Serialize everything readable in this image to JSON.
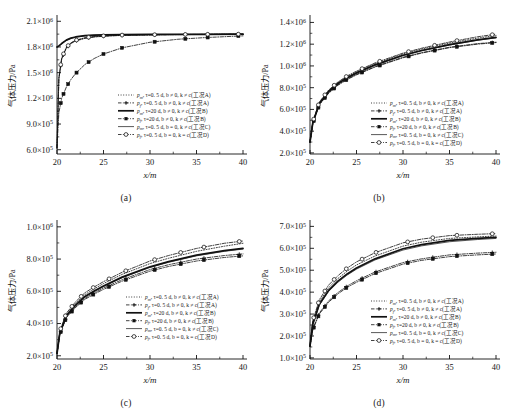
{
  "figure": {
    "title": "",
    "axis": {
      "xlabel": "x/m",
      "ylabel_cn": "气体压力",
      "ylabel_unit": "/Pa",
      "xticks": [
        "20",
        "25",
        "30",
        "35",
        "40"
      ],
      "xlim": [
        20,
        40
      ]
    },
    "legend": [
      {
        "id": "pm-A",
        "symbol": "p",
        "sub": "m",
        "rest": ", τ=0. 5 d, b ≠ 0, k ≠ c(工况A)",
        "style": "dotted",
        "marker": "none"
      },
      {
        "id": "pf-A",
        "symbol": "p",
        "sub": "f",
        "rest": ", τ=0. 5 d, b ≠ 0, k ≠ c(工况A)",
        "style": "dashdot",
        "marker": "cross"
      },
      {
        "id": "pm-B",
        "symbol": "p",
        "sub": "m",
        "rest": ", τ=20 d, b ≠ 0, k ≠ c(工况B)",
        "style": "solid-bold",
        "marker": "none"
      },
      {
        "id": "pf-B",
        "symbol": "p",
        "sub": "f",
        "rest": ", τ=20 d, b ≠ 0, k ≠ c(工况B)",
        "style": "dashdot",
        "marker": "square"
      },
      {
        "id": "pm-C",
        "symbol": "p",
        "sub": "m",
        "rest": ", τ=0. 5 d, b = 0, k ≠ c(工况C)",
        "style": "solid-thin",
        "marker": "none"
      },
      {
        "id": "pf-D",
        "symbol": "p",
        "sub": "f",
        "rest": ", τ=0. 5 d, b = 0, k = c(工况D)",
        "style": "dashdot",
        "marker": "circle"
      }
    ],
    "panels": [
      {
        "key": "a",
        "label": "(a)"
      },
      {
        "key": "b",
        "label": "(b)"
      },
      {
        "key": "c",
        "label": "(c)"
      },
      {
        "key": "d",
        "label": "(d)"
      }
    ]
  },
  "chart_data": [
    {
      "panel": "(a)",
      "type": "line",
      "title": "",
      "xlabel": "x/m",
      "ylabel": "气体压力/Pa",
      "xlim": [
        20,
        40
      ],
      "ylim": [
        550000,
        2150000
      ],
      "yticks": [
        600000,
        900000,
        1200000,
        1500000,
        1800000,
        2100000
      ],
      "ytick_labels": [
        "6.0×10⁵",
        "9.0×10⁵",
        "1.2×10⁶",
        "1.5×10⁶",
        "1.8×10⁶",
        "2.1×10⁶"
      ],
      "xticks": [
        20,
        25,
        30,
        35,
        40
      ],
      "grid": false,
      "legend_position": "center",
      "x": [
        20.0,
        20.2,
        20.5,
        21.0,
        21.5,
        22.0,
        23.0,
        24.0,
        25.0,
        27.0,
        30.0,
        33.0,
        36.0,
        40.0
      ],
      "series": [
        {
          "name": "pm-A",
          "values": [
            620000,
            1430000,
            1660000,
            1790000,
            1845000,
            1875000,
            1905000,
            1920000,
            1928000,
            1937000,
            1942000,
            1945000,
            1947000,
            1949000
          ]
        },
        {
          "name": "pf-A",
          "values": [
            615000,
            1425000,
            1655000,
            1785000,
            1840000,
            1870000,
            1900000,
            1916000,
            1925000,
            1935000,
            1941000,
            1944000,
            1946000,
            1948000
          ]
        },
        {
          "name": "pm-B",
          "values": [
            1800000,
            1812000,
            1840000,
            1880000,
            1903000,
            1917000,
            1932000,
            1938000,
            1941000,
            1944000,
            1946000,
            1947000,
            1948000,
            1949000
          ]
        },
        {
          "name": "pf-B",
          "values": [
            630000,
            1030000,
            1200000,
            1330000,
            1420000,
            1490000,
            1595000,
            1665000,
            1718000,
            1790000,
            1855000,
            1890000,
            1910000,
            1930000
          ]
        },
        {
          "name": "pm-C",
          "values": [
            1798000,
            1810000,
            1838000,
            1878000,
            1901000,
            1915000,
            1930000,
            1937000,
            1940000,
            1943000,
            1945000,
            1946000,
            1947000,
            1948000
          ]
        },
        {
          "name": "pf-D",
          "values": [
            625000,
            1440000,
            1670000,
            1795000,
            1848000,
            1878000,
            1908000,
            1922000,
            1930000,
            1939000,
            1943000,
            1946000,
            1948000,
            1950000
          ]
        }
      ]
    },
    {
      "panel": "(b)",
      "type": "line",
      "title": "",
      "xlabel": "x/m",
      "ylabel": "气体压力/Pa",
      "xlim": [
        20,
        40
      ],
      "ylim": [
        190000,
        1450000
      ],
      "yticks": [
        200000,
        400000,
        600000,
        800000,
        1000000,
        1200000,
        1400000
      ],
      "ytick_labels": [
        "2.0×10⁵",
        "4.0×10⁵",
        "6.0×10⁵",
        "8.0×10⁵",
        "1.0×10⁶",
        "1.2×10⁶",
        "1.4×10⁶"
      ],
      "xticks": [
        20,
        25,
        30,
        35,
        40
      ],
      "grid": false,
      "legend_position": "center",
      "x": [
        20.0,
        20.3,
        21.0,
        22.0,
        23.0,
        24.0,
        25.0,
        27.0,
        30.0,
        32.0,
        35.0,
        38.0,
        40.0
      ],
      "series": [
        {
          "name": "pm-A",
          "values": [
            300000,
            480000,
            660000,
            770000,
            845000,
            900000,
            945000,
            1020000,
            1110000,
            1155000,
            1210000,
            1255000,
            1280000
          ]
        },
        {
          "name": "pf-A",
          "values": [
            300000,
            470000,
            645000,
            752000,
            826000,
            880000,
            922000,
            995000,
            1080000,
            1122000,
            1172000,
            1205000,
            1218000
          ]
        },
        {
          "name": "pm-B",
          "values": [
            300000,
            477000,
            655000,
            765000,
            838000,
            892000,
            936000,
            1010000,
            1098000,
            1142000,
            1196000,
            1240000,
            1262000
          ]
        },
        {
          "name": "pf-B",
          "values": [
            300000,
            468000,
            642000,
            748000,
            822000,
            875000,
            918000,
            990000,
            1075000,
            1118000,
            1168000,
            1200000,
            1215000
          ]
        },
        {
          "name": "pm-C",
          "values": [
            300000,
            475000,
            652000,
            762000,
            835000,
            889000,
            933000,
            1007000,
            1095000,
            1139000,
            1192000,
            1236000,
            1258000
          ]
        },
        {
          "name": "pf-D",
          "values": [
            300000,
            485000,
            668000,
            778000,
            852000,
            908000,
            952000,
            1028000,
            1118000,
            1163000,
            1220000,
            1268000,
            1292000
          ]
        }
      ]
    },
    {
      "panel": "(c)",
      "type": "line",
      "title": "",
      "xlabel": "x/m",
      "ylabel": "气体压力/Pa",
      "xlim": [
        20,
        40
      ],
      "ylim": [
        180000,
        1030000
      ],
      "yticks": [
        200000,
        400000,
        600000,
        800000,
        1000000
      ],
      "ytick_labels": [
        "2.0×10⁵",
        "4.0×10⁵",
        "6.0×10⁵",
        "8.0×10⁵",
        "1.0×10⁶"
      ],
      "xticks": [
        20,
        25,
        30,
        35,
        40
      ],
      "grid": false,
      "legend_position": "center-right",
      "x": [
        20.0,
        20.3,
        21.0,
        22.0,
        23.0,
        24.0,
        25.0,
        27.0,
        30.0,
        32.0,
        35.0,
        38.0,
        40.0
      ],
      "series": [
        {
          "name": "pm-A",
          "values": [
            215000,
            345000,
            455000,
            525000,
            580000,
            615000,
            648000,
            705000,
            772000,
            805000,
            848000,
            880000,
            898000
          ]
        },
        {
          "name": "pf-A",
          "values": [
            212000,
            335000,
            440000,
            505000,
            556000,
            590000,
            620000,
            672000,
            735000,
            765000,
            800000,
            822000,
            832000
          ]
        },
        {
          "name": "pm-B",
          "values": [
            214000,
            340000,
            448000,
            515000,
            568000,
            602000,
            633000,
            688000,
            752000,
            784000,
            824000,
            852000,
            866000
          ]
        },
        {
          "name": "pf-B",
          "values": [
            211000,
            332000,
            436000,
            500000,
            550000,
            583000,
            612000,
            663000,
            725000,
            754000,
            788000,
            810000,
            820000
          ]
        },
        {
          "name": "pm-C",
          "values": [
            213000,
            338000,
            445000,
            512000,
            564000,
            598000,
            629000,
            684000,
            748000,
            780000,
            820000,
            848000,
            862000
          ]
        },
        {
          "name": "pf-D",
          "values": [
            216000,
            352000,
            464000,
            535000,
            591000,
            627000,
            660000,
            718000,
            788000,
            822000,
            866000,
            898000,
            912000
          ]
        }
      ]
    },
    {
      "panel": "(d)",
      "type": "line",
      "title": "",
      "xlabel": "x/m",
      "ylabel": "气体压力/Pa",
      "xlim": [
        20,
        40
      ],
      "ylim": [
        95000,
        720000
      ],
      "yticks": [
        100000,
        200000,
        300000,
        400000,
        500000,
        600000,
        700000
      ],
      "ytick_labels": [
        "1.0×10⁵",
        "2.0×10⁵",
        "3.0×10⁵",
        "4.0×10⁵",
        "5.0×10⁵",
        "6.0×10⁵",
        "7.0×10⁵"
      ],
      "xticks": [
        20,
        25,
        30,
        35,
        40
      ],
      "grid": false,
      "legend_position": "center",
      "x": [
        20.0,
        20.3,
        21.0,
        22.0,
        23.0,
        24.0,
        25.0,
        27.0,
        30.0,
        32.0,
        35.0,
        38.0,
        40.0
      ],
      "series": [
        {
          "name": "pm-A",
          "values": [
            155000,
            262000,
            355000,
            420000,
            462000,
            496000,
            524000,
            565000,
            610000,
            628000,
            645000,
            652000,
            656000
          ]
        },
        {
          "name": "pf-A",
          "values": [
            152000,
            232000,
            305000,
            360000,
            398000,
            428000,
            452000,
            492000,
            535000,
            552000,
            570000,
            578000,
            582000
          ]
        },
        {
          "name": "pm-B",
          "values": [
            154000,
            255000,
            345000,
            408000,
            450000,
            483000,
            510000,
            552000,
            598000,
            617000,
            636000,
            645000,
            650000
          ]
        },
        {
          "name": "pf-B",
          "values": [
            151000,
            228000,
            300000,
            354000,
            392000,
            422000,
            445000,
            485000,
            528000,
            545000,
            562000,
            570000,
            574000
          ]
        },
        {
          "name": "pm-C",
          "values": [
            153000,
            250000,
            340000,
            403000,
            445000,
            478000,
            505000,
            547000,
            592000,
            611000,
            630000,
            640000,
            645000
          ]
        },
        {
          "name": "pf-D",
          "values": [
            157000,
            270000,
            365000,
            432000,
            475000,
            510000,
            538000,
            580000,
            625000,
            642000,
            658000,
            664000,
            667000
          ]
        }
      ]
    }
  ]
}
